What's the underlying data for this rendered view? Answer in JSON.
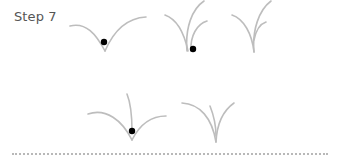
{
  "step": {
    "label": "Step 7"
  },
  "colors": {
    "stroke": "#bdbdbd",
    "dot": "#000000",
    "divider": "#b8b8b8",
    "label": "#555555"
  },
  "figures": [
    {
      "name": "figure-1",
      "has_dot": true
    },
    {
      "name": "figure-2",
      "has_dot": true
    },
    {
      "name": "figure-3",
      "has_dot": false
    },
    {
      "name": "figure-4",
      "has_dot": true
    },
    {
      "name": "figure-5",
      "has_dot": false
    }
  ]
}
